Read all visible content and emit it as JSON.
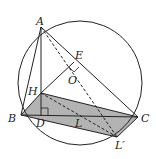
{
  "diagram": {
    "type": "geometry",
    "colors": {
      "stroke": "#222222",
      "shade": "#b3b3b3",
      "background": "#ffffff"
    },
    "circle": {
      "cx": 80,
      "cy": 83,
      "r": 62
    },
    "points": {
      "A": {
        "label": "A",
        "x": 41,
        "y": 27
      },
      "B": {
        "label": "B",
        "x": 21,
        "y": 115
      },
      "C": {
        "label": "C",
        "x": 138,
        "y": 117
      },
      "D": {
        "label": "D",
        "x": 41,
        "y": 116
      },
      "H": {
        "label": "H",
        "x": 41,
        "y": 93
      },
      "E": {
        "label": "E",
        "x": 74,
        "y": 62
      },
      "O": {
        "label": "O",
        "x": 78,
        "y": 80
      },
      "L": {
        "label": "L",
        "x": 80,
        "y": 117
      },
      "Lp": {
        "label": "L′",
        "x": 117,
        "y": 137
      }
    },
    "labels": {
      "A": "A",
      "B": "B",
      "C": "C",
      "D": "D",
      "E": "E",
      "H": "H",
      "O": "O",
      "L": "L",
      "Lp": "L′"
    }
  }
}
